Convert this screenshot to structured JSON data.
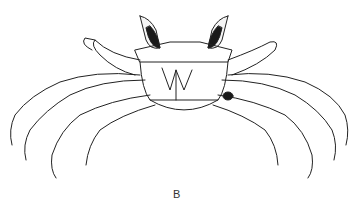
{
  "figure": {
    "label": "B"
  }
}
